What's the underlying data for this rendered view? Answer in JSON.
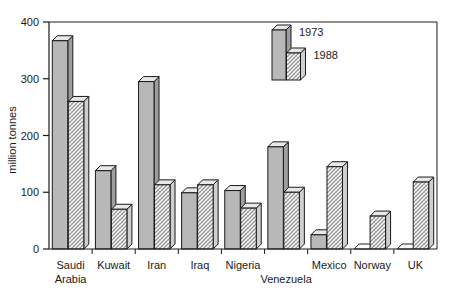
{
  "chart_data": {
    "type": "bar",
    "title": "",
    "subtitle": "",
    "xlabel": "",
    "ylabel": "million tonnes",
    "ylim": [
      0,
      400
    ],
    "yticks": [
      0,
      100,
      200,
      300,
      400
    ],
    "ytick_labels": [
      "0",
      "100",
      "200",
      "300",
      "400"
    ],
    "grid": false,
    "legend_position": "inside-top-right",
    "categories": [
      "Saudi Arabia",
      "Kuwait",
      "Iran",
      "Iraq",
      "Nigeria",
      "Venezuela",
      "Mexico",
      "Norway",
      "UK"
    ],
    "category_lines": [
      [
        "Saudi",
        "Arabia"
      ],
      [
        "Kuwait",
        ""
      ],
      [
        "Iran",
        ""
      ],
      [
        "Iraq",
        ""
      ],
      [
        "Nigeria",
        ""
      ],
      [
        "",
        "Venezuela"
      ],
      [
        "Mexico",
        ""
      ],
      [
        "Norway",
        ""
      ],
      [
        "UK",
        ""
      ]
    ],
    "series": [
      {
        "name": "1973",
        "style": "solid-grey",
        "color": "#b8b8b8",
        "values": [
          367,
          138,
          295,
          99,
          103,
          180,
          25,
          2,
          1
        ]
      },
      {
        "name": "1988",
        "style": "hatched",
        "color": "#d8d8d8",
        "values": [
          260,
          70,
          113,
          113,
          72,
          100,
          145,
          58,
          118
        ]
      }
    ]
  },
  "legend": {
    "items": [
      {
        "label": "1973",
        "style": "solid-grey"
      },
      {
        "label": "1988",
        "style": "hatched"
      }
    ]
  },
  "axis": {
    "y_title": "million tonnes"
  },
  "colors": {
    "bar_1973_face": "#b8b8b8",
    "bar_1988_face": "#dcdcdc",
    "bar_top": "#e8e8e8",
    "outline": "#1a1a1a",
    "background": "#ffffff"
  }
}
